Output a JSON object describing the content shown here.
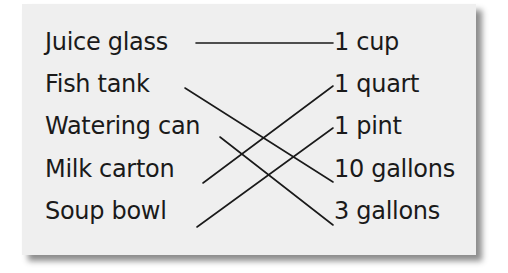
{
  "left_items": [
    {
      "label": "Juice glass"
    },
    {
      "label": "Fish tank"
    },
    {
      "label": "Watering can"
    },
    {
      "label": "Milk carton"
    },
    {
      "label": "Soup bowl"
    }
  ],
  "right_items": [
    {
      "label": "1 cup"
    },
    {
      "label": "1 quart"
    },
    {
      "label": "1 pint"
    },
    {
      "label": "10 gallons"
    },
    {
      "label": "3 gallons"
    }
  ],
  "matches": [
    {
      "from": "Juice glass",
      "to": "1 cup"
    },
    {
      "from": "Fish tank",
      "to": "10 gallons"
    },
    {
      "from": "Watering can",
      "to": "3 gallons"
    },
    {
      "from": "Milk carton",
      "to": "1 quart"
    },
    {
      "from": "Soup bowl",
      "to": "1 pint"
    }
  ],
  "colors": {
    "card_background": "#efefef",
    "ink": "#1a1a1a",
    "page_background": "#ffffff"
  }
}
